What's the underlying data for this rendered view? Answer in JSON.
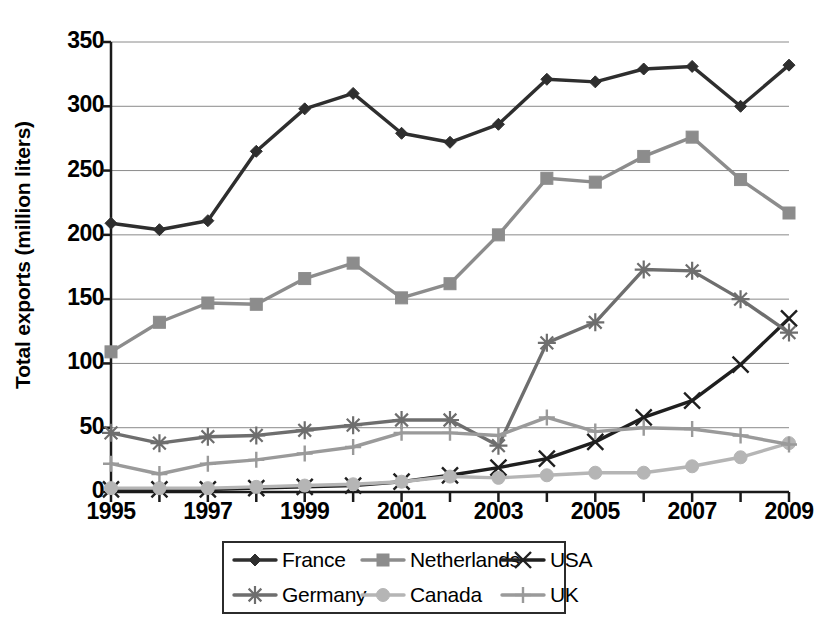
{
  "chart_data": {
    "type": "line",
    "title": "",
    "xlabel": "",
    "ylabel": "Total exports (million liters)",
    "x": [
      1995,
      1996,
      1997,
      1998,
      1999,
      2000,
      2001,
      2002,
      2003,
      2004,
      2005,
      2006,
      2007,
      2008,
      2009
    ],
    "xtick_labels": [
      "1995",
      "1997",
      "1999",
      "2001",
      "2003",
      "2005",
      "2007",
      "2009"
    ],
    "xtick_values": [
      1995,
      1997,
      1999,
      2001,
      2003,
      2005,
      2007,
      2009
    ],
    "ytick_labels": [
      "0",
      "50",
      "100",
      "150",
      "200",
      "250",
      "300",
      "350"
    ],
    "ytick_values": [
      0,
      50,
      100,
      150,
      200,
      250,
      300,
      350
    ],
    "xlim": [
      1995,
      2009
    ],
    "ylim": [
      0,
      350
    ],
    "grid": "horizontal",
    "legend_position": "bottom",
    "series": [
      {
        "name": "France",
        "marker": "diamond",
        "color": "#2e2e2e",
        "values": [
          209,
          204,
          211,
          265,
          298,
          310,
          279,
          272,
          286,
          321,
          319,
          329,
          331,
          300,
          332
        ]
      },
      {
        "name": "Netherlands",
        "marker": "square",
        "color": "#8c8c8c",
        "values": [
          109,
          132,
          147,
          146,
          166,
          178,
          151,
          162,
          200,
          244,
          241,
          261,
          276,
          243,
          217
        ]
      },
      {
        "name": "USA",
        "marker": "cross-x",
        "color": "#1f1f1f",
        "values": [
          2,
          2,
          2,
          3,
          4,
          5,
          8,
          13,
          19,
          26,
          39,
          58,
          71,
          99,
          135
        ]
      },
      {
        "name": "Germany",
        "marker": "asterisk",
        "color": "#6e6e6e",
        "values": [
          46,
          38,
          43,
          44,
          48,
          52,
          56,
          56,
          36,
          116,
          132,
          173,
          172,
          150,
          124
        ]
      },
      {
        "name": "Canada",
        "marker": "circle",
        "color": "#b5b5b5",
        "values": [
          3,
          3,
          3,
          4,
          5,
          6,
          8,
          12,
          11,
          13,
          15,
          15,
          20,
          27,
          38
        ]
      },
      {
        "name": "UK",
        "marker": "plus",
        "color": "#9a9a9a",
        "values": [
          22,
          14,
          22,
          25,
          30,
          35,
          46,
          46,
          44,
          58,
          47,
          50,
          49,
          44,
          37
        ]
      }
    ]
  },
  "legend": {
    "items": [
      {
        "label": "France"
      },
      {
        "label": "Netherlands"
      },
      {
        "label": "USA"
      },
      {
        "label": "Germany"
      },
      {
        "label": "Canada"
      },
      {
        "label": "UK"
      }
    ]
  }
}
